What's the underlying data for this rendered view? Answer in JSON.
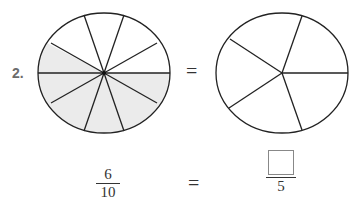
{
  "problem": {
    "number": "2.",
    "equals_symbol": "=",
    "left_fraction": {
      "numerator": "6",
      "denominator": "10"
    },
    "right_fraction": {
      "numerator": "",
      "denominator": "5"
    },
    "left_circle": {
      "total_parts": 10,
      "shaded_parts": 6,
      "shade_color": "#ebebeb"
    },
    "right_circle": {
      "total_parts": 5,
      "shaded_parts": 0
    }
  }
}
